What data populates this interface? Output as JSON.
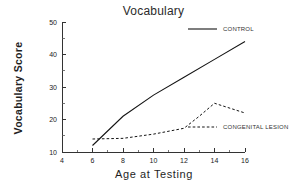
{
  "chart_data": {
    "type": "line",
    "title": "Vocabulary",
    "xlabel": "Age  at  Testing",
    "ylabel": "Vocabulary  Score",
    "xlim": [
      4,
      16
    ],
    "ylim": [
      10,
      50
    ],
    "x_ticks": [
      4,
      6,
      8,
      10,
      12,
      14,
      16
    ],
    "y_ticks": [
      10,
      20,
      30,
      40,
      50
    ],
    "x_tick_labels": [
      "4",
      "6",
      "8",
      "10",
      "12",
      "14",
      "16"
    ],
    "y_tick_labels": [
      "10",
      "20",
      "30",
      "40",
      "50"
    ],
    "x_minor_step": 1,
    "y_minor_step": 5,
    "grid": false,
    "legend_position": "inside-right",
    "series": [
      {
        "name": "CONTROL",
        "style": "solid",
        "color": "#141414",
        "x": [
          6,
          8,
          10,
          12,
          14,
          16
        ],
        "values": [
          12,
          21,
          27.5,
          33,
          38.5,
          44
        ]
      },
      {
        "name": "CONGENITAL LESION",
        "style": "dashed",
        "color": "#141414",
        "x": [
          6,
          8,
          10,
          12,
          13,
          14,
          16
        ],
        "values": [
          14,
          14.2,
          15.5,
          17.3,
          21,
          25,
          22
        ]
      }
    ],
    "legend": [
      {
        "label": "CONTROL",
        "style": "solid"
      },
      {
        "label": "CONGENITAL LESION",
        "style": "dashed"
      }
    ]
  }
}
